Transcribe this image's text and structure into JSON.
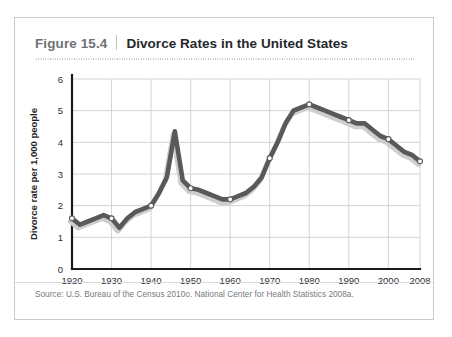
{
  "figure": {
    "number": "Figure 15.4",
    "title": "Divorce Rates in the United States",
    "source": "Source:  U.S. Bureau of the Census 2010o. National Center for Health Statistics 2008a."
  },
  "colors": {
    "line": "#58595b",
    "line_shadow": "#cccecf",
    "grid": "#d2d4d6",
    "axis": "#1a1a1a",
    "card_border": "#c9cbcd",
    "title_number": "#6e7276",
    "title_text": "#25282b",
    "source_text": "#76797c"
  },
  "chart_data": {
    "type": "line",
    "title": "Divorce Rates in the United States",
    "xlabel": "",
    "ylabel": "Divorce rate per 1,000 people",
    "xlim": [
      1920,
      2008
    ],
    "ylim": [
      0,
      6
    ],
    "grid": true,
    "legend": "none",
    "xticks": [
      "1920",
      "1930",
      "1940",
      "1950",
      "1960",
      "1970",
      "1980",
      "1990",
      "2000",
      "2008"
    ],
    "xtick_values": [
      1920,
      1930,
      1940,
      1950,
      1960,
      1970,
      1980,
      1990,
      2000,
      2008
    ],
    "yticks": [
      "0",
      "1",
      "2",
      "3",
      "4",
      "5",
      "6"
    ],
    "ytick_values": [
      0,
      1,
      2,
      3,
      4,
      5,
      6
    ],
    "series": [
      {
        "name": "Divorce rate per 1,000 people",
        "x": [
          1920,
          1922,
          1924,
          1926,
          1928,
          1930,
          1932,
          1934,
          1936,
          1938,
          1940,
          1942,
          1944,
          1946,
          1948,
          1950,
          1952,
          1954,
          1956,
          1958,
          1960,
          1962,
          1964,
          1966,
          1968,
          1970,
          1972,
          1974,
          1976,
          1978,
          1980,
          1982,
          1984,
          1986,
          1988,
          1990,
          1992,
          1994,
          1996,
          1998,
          2000,
          2002,
          2004,
          2006,
          2008
        ],
        "values": [
          1.6,
          1.4,
          1.5,
          1.6,
          1.7,
          1.6,
          1.3,
          1.6,
          1.8,
          1.9,
          2.0,
          2.4,
          2.9,
          4.35,
          2.8,
          2.55,
          2.5,
          2.4,
          2.3,
          2.2,
          2.2,
          2.3,
          2.4,
          2.6,
          2.9,
          3.5,
          4.0,
          4.6,
          5.0,
          5.1,
          5.2,
          5.1,
          5.0,
          4.9,
          4.8,
          4.7,
          4.6,
          4.6,
          4.4,
          4.2,
          4.1,
          3.9,
          3.7,
          3.6,
          3.4
        ]
      }
    ],
    "markers": [
      {
        "x": 1920,
        "y": 1.6
      },
      {
        "x": 1930,
        "y": 1.6
      },
      {
        "x": 1940,
        "y": 2.0
      },
      {
        "x": 1950,
        "y": 2.55
      },
      {
        "x": 1960,
        "y": 2.2
      },
      {
        "x": 1970,
        "y": 3.5
      },
      {
        "x": 1980,
        "y": 5.2
      },
      {
        "x": 1990,
        "y": 4.7
      },
      {
        "x": 2000,
        "y": 4.1
      },
      {
        "x": 2008,
        "y": 3.4
      }
    ],
    "annotations": {
      "peak_label": "1946 postwar spike",
      "peak_value": 4.35
    }
  }
}
